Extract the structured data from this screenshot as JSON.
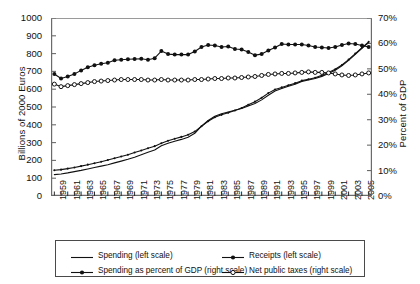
{
  "chart_data": {
    "type": "line",
    "title": "",
    "xlabel": "",
    "ylabel": "Billions of 2000 Euros",
    "ylabel_right": "Percent of GDP",
    "ylim": [
      0,
      1000
    ],
    "ytick_step": 100,
    "ylim_right": [
      0,
      70
    ],
    "ytick_step_right": 10,
    "grid": false,
    "legend_position": "bottom",
    "x": [
      1959,
      1960,
      1961,
      1962,
      1963,
      1964,
      1965,
      1966,
      1967,
      1968,
      1969,
      1970,
      1971,
      1972,
      1973,
      1974,
      1975,
      1976,
      1977,
      1978,
      1979,
      1980,
      1981,
      1982,
      1983,
      1984,
      1985,
      1986,
      1987,
      1988,
      1989,
      1990,
      1991,
      1992,
      1993,
      1994,
      1995,
      1996,
      1997,
      1998,
      1999,
      2000,
      2001,
      2002,
      2003,
      2004,
      2005,
      2006
    ],
    "xtick_labels": [
      "1959",
      "1961",
      "1963",
      "1965",
      "1967",
      "1969",
      "1971",
      "1973",
      "1975",
      "1977",
      "1979",
      "1981",
      "1983",
      "1985",
      "1987",
      "1989",
      "1991",
      "1993",
      "1995",
      "1997",
      "1999",
      "2001",
      "2003",
      "2005"
    ],
    "ytick_labels": [
      "0",
      "100",
      "200",
      "300",
      "400",
      "500",
      "600",
      "700",
      "800",
      "900",
      "1000"
    ],
    "ytick_labels_right": [
      "0%",
      "10%",
      "20%",
      "30%",
      "40%",
      "50%",
      "60%",
      "70%"
    ],
    "series": [
      {
        "name": "Spending (left scale)",
        "axis": "left",
        "marker": "none",
        "legend_symbol": "line",
        "values": [
          120,
          124,
          130,
          137,
          144,
          152,
          160,
          168,
          176,
          186,
          196,
          206,
          218,
          232,
          246,
          258,
          282,
          296,
          308,
          318,
          330,
          352,
          392,
          424,
          448,
          462,
          472,
          482,
          492,
          506,
          520,
          540,
          566,
          590,
          604,
          616,
          628,
          644,
          652,
          660,
          672,
          688,
          706,
          732,
          762,
          796,
          830,
          862
        ]
      },
      {
        "name": "Receipts (left scale)",
        "axis": "left",
        "marker": "small-dot",
        "legend_symbol": "line-dot",
        "values": [
          145,
          148,
          154,
          160,
          168,
          176,
          184,
          192,
          202,
          212,
          222,
          232,
          244,
          256,
          268,
          280,
          296,
          310,
          322,
          332,
          344,
          362,
          392,
          420,
          442,
          456,
          468,
          480,
          494,
          512,
          530,
          552,
          578,
          598,
          610,
          622,
          634,
          648,
          656,
          664,
          678,
          694,
          712,
          736,
          766,
          800,
          834,
          866
        ]
      },
      {
        "name": "Spending as percent of GDP (right scale)",
        "axis": "right",
        "marker": "filled-dot",
        "legend_symbol": "line-filled-dot",
        "values": [
          48.0,
          46.2,
          47.0,
          48.0,
          49.4,
          50.6,
          51.4,
          52.0,
          52.4,
          53.4,
          53.6,
          53.8,
          53.9,
          54.0,
          53.6,
          54.2,
          57.0,
          55.8,
          55.6,
          55.6,
          55.6,
          56.8,
          58.6,
          59.4,
          59.2,
          58.6,
          58.8,
          57.8,
          57.6,
          56.6,
          55.4,
          55.8,
          57.2,
          58.4,
          59.8,
          59.6,
          59.6,
          59.6,
          59.2,
          58.6,
          58.4,
          58.2,
          58.6,
          59.4,
          60.0,
          59.8,
          59.2,
          58.6
        ]
      },
      {
        "name": "Net public taxes (right scale)",
        "axis": "right",
        "marker": "open-dot",
        "legend_symbol": "line-open-dot",
        "values": [
          44.0,
          43.0,
          43.4,
          43.8,
          44.2,
          44.6,
          45.0,
          45.2,
          45.4,
          45.6,
          45.8,
          45.8,
          45.8,
          45.8,
          45.6,
          45.6,
          45.8,
          45.6,
          45.6,
          45.6,
          45.6,
          45.8,
          45.8,
          46.0,
          46.2,
          46.2,
          46.4,
          46.4,
          46.6,
          46.8,
          47.0,
          47.4,
          47.8,
          48.0,
          48.2,
          48.2,
          48.4,
          48.6,
          48.8,
          48.6,
          48.6,
          48.4,
          48.0,
          47.6,
          47.4,
          47.6,
          48.0,
          48.4
        ]
      }
    ]
  },
  "legend": {
    "items": [
      {
        "label": "Spending (left scale)"
      },
      {
        "label": "Receipts (left scale)"
      },
      {
        "label": "Spending as percent of GDP (right scale)"
      },
      {
        "label": "Net public taxes (right scale)"
      }
    ]
  }
}
